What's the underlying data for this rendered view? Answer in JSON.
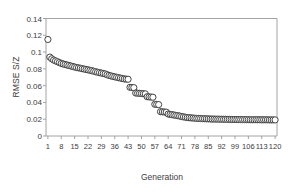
{
  "chart_data": {
    "type": "scatter",
    "title": "",
    "xlabel": "Generation",
    "ylabel": "RMSE S/Z",
    "xlim": [
      0,
      121
    ],
    "ylim": [
      0,
      0.14
    ],
    "grid": false,
    "legend": null,
    "marker": {
      "shape": "circle",
      "fill": "#ffffff",
      "stroke": "#3a3a3a",
      "size_px": 3.1
    },
    "axis_color": "#9a9a9a",
    "x_ticks": [
      1,
      8,
      15,
      22,
      29,
      36,
      43,
      50,
      57,
      64,
      71,
      78,
      85,
      92,
      99,
      106,
      113,
      120
    ],
    "y_ticks": [
      "0",
      "0.02",
      "0.04",
      "0.06",
      "0.08",
      "0.1",
      "0.12",
      "0.14"
    ],
    "y_tick_values": [
      0,
      0.02,
      0.04,
      0.06,
      0.08,
      0.1,
      0.12,
      0.14
    ],
    "x": [
      1,
      2,
      3,
      4,
      5,
      6,
      7,
      8,
      9,
      10,
      11,
      12,
      13,
      14,
      15,
      16,
      17,
      18,
      19,
      20,
      21,
      22,
      23,
      24,
      25,
      26,
      27,
      28,
      29,
      30,
      31,
      32,
      33,
      34,
      35,
      36,
      37,
      38,
      39,
      40,
      41,
      42,
      43,
      44,
      45,
      46,
      47,
      48,
      49,
      50,
      51,
      52,
      53,
      54,
      55,
      56,
      57,
      58,
      59,
      60,
      61,
      62,
      63,
      64,
      65,
      66,
      67,
      68,
      69,
      70,
      71,
      72,
      73,
      74,
      75,
      76,
      77,
      78,
      79,
      80,
      81,
      82,
      83,
      84,
      85,
      86,
      87,
      88,
      89,
      90,
      91,
      92,
      93,
      94,
      95,
      96,
      97,
      98,
      99,
      100,
      101,
      102,
      103,
      104,
      105,
      106,
      107,
      108,
      109,
      110,
      111,
      112,
      113,
      114,
      115,
      116,
      117,
      118,
      119,
      120
    ],
    "y": [
      0.115,
      0.094,
      0.092,
      0.0905,
      0.0895,
      0.0885,
      0.0875,
      0.0865,
      0.0858,
      0.0852,
      0.0846,
      0.084,
      0.0834,
      0.0828,
      0.0822,
      0.0816,
      0.0812,
      0.0808,
      0.0802,
      0.0798,
      0.0793,
      0.0788,
      0.0783,
      0.0778,
      0.0772,
      0.0766,
      0.076,
      0.0755,
      0.075,
      0.0745,
      0.074,
      0.073,
      0.0722,
      0.0716,
      0.071,
      0.0705,
      0.07,
      0.0695,
      0.069,
      0.0685,
      0.068,
      0.0678,
      0.0676,
      0.058,
      0.0578,
      0.0576,
      0.0512,
      0.051,
      0.0508,
      0.0506,
      0.0504,
      0.0502,
      0.0468,
      0.0466,
      0.0464,
      0.0462,
      0.0378,
      0.0376,
      0.0374,
      0.029,
      0.0288,
      0.0286,
      0.0284,
      0.0262,
      0.0258,
      0.0254,
      0.025,
      0.0246,
      0.0242,
      0.0238,
      0.0232,
      0.0228,
      0.0224,
      0.022,
      0.0218,
      0.0216,
      0.0214,
      0.0212,
      0.021,
      0.0209,
      0.0208,
      0.0207,
      0.0206,
      0.0205,
      0.0204,
      0.0203,
      0.0202,
      0.0202,
      0.0201,
      0.0201,
      0.02,
      0.02,
      0.0199,
      0.0199,
      0.0198,
      0.0198,
      0.0197,
      0.0197,
      0.0197,
      0.0196,
      0.0196,
      0.0196,
      0.0195,
      0.0195,
      0.0195,
      0.0195,
      0.0194,
      0.0194,
      0.0194,
      0.0194,
      0.0194,
      0.0193,
      0.0193,
      0.0193,
      0.0193,
      0.0193,
      0.0192,
      0.0192,
      0.0192,
      0.0192,
      0.0192,
      0.0192
    ]
  }
}
